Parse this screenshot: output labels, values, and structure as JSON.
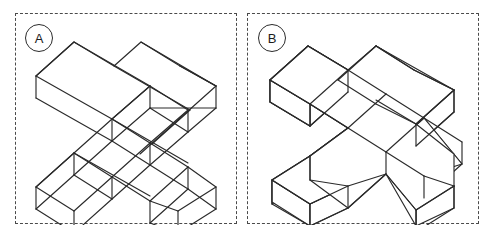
{
  "figure": {
    "title": "",
    "background_color": "#ffffff",
    "line_color": "#2a2a2a",
    "border_style": "dashed",
    "border_color": "#4a4a4a",
    "panel_count": 2
  },
  "panels": [
    {
      "id": "A",
      "label": "A",
      "badge_icon": "circled-letter-icon",
      "object_name": "isometric-cross-wireframe",
      "rendering": "transparent wireframe, hidden edges shown",
      "description": "3D isometric plus/cross shaped solid drawn as a see-through wireframe with all internal and hidden edges visible"
    },
    {
      "id": "B",
      "label": "B",
      "badge_icon": "circled-letter-icon",
      "object_name": "isometric-cross-solid",
      "rendering": "opaque solid, hidden edges removed",
      "description": "The same 3D isometric plus/cross shaped solid drawn opaque with hidden-line removal"
    }
  ]
}
